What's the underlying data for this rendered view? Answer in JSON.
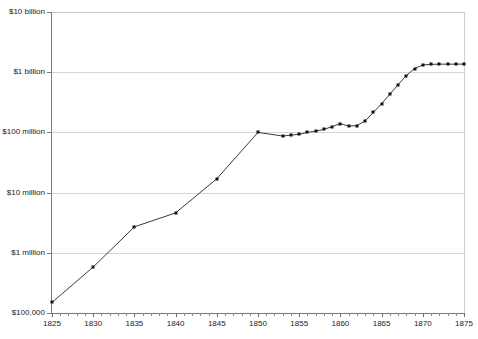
{
  "chart_data": {
    "type": "line",
    "title": "",
    "subtitle": "",
    "xlabel": "",
    "ylabel": "",
    "yscale": "log",
    "ylim": [
      100000,
      10000000000
    ],
    "xlim": [
      1825,
      1875
    ],
    "grid": true,
    "legend": null,
    "y_tick_labels": [
      "$10 billion",
      "$1 billion",
      "$100 million",
      "$10 million",
      "$1 million",
      "$100,000"
    ],
    "y_tick_values": [
      10000000000,
      1000000000,
      100000000,
      10000000,
      1000000,
      100000
    ],
    "x_tick_labels": [
      "1825",
      "1830",
      "1835",
      "1840",
      "1845",
      "1850",
      "1855",
      "1860",
      "1865",
      "1870",
      "1875"
    ],
    "x_tick_values": [
      1825,
      1830,
      1835,
      1840,
      1845,
      1850,
      1855,
      1860,
      1865,
      1870,
      1875
    ],
    "x_minor_tick_step": 1,
    "series": [
      {
        "name": "value",
        "marker": "square",
        "marker_color": "#111111",
        "line_color": "#3a3a3a",
        "x": [
          1825,
          1830,
          1835,
          1840,
          1845,
          1850,
          1853,
          1854,
          1855,
          1856,
          1857,
          1858,
          1859,
          1860,
          1861,
          1862,
          1863,
          1864,
          1865,
          1866,
          1867,
          1868,
          1869,
          1870,
          1871,
          1872,
          1873,
          1874,
          1875
        ],
        "values": [
          150000,
          580000,
          2700000,
          4600000,
          17000000,
          100000000,
          87000000,
          90000000,
          93000000,
          100000000,
          105000000,
          112000000,
          125000000,
          140000000,
          127000000,
          130000000,
          155000000,
          215000000,
          300000000,
          430000000,
          620000000,
          880000000,
          1150000000,
          1320000000,
          1350000000,
          1360000000,
          1360000000,
          1360000000,
          1365000000
        ]
      }
    ]
  }
}
